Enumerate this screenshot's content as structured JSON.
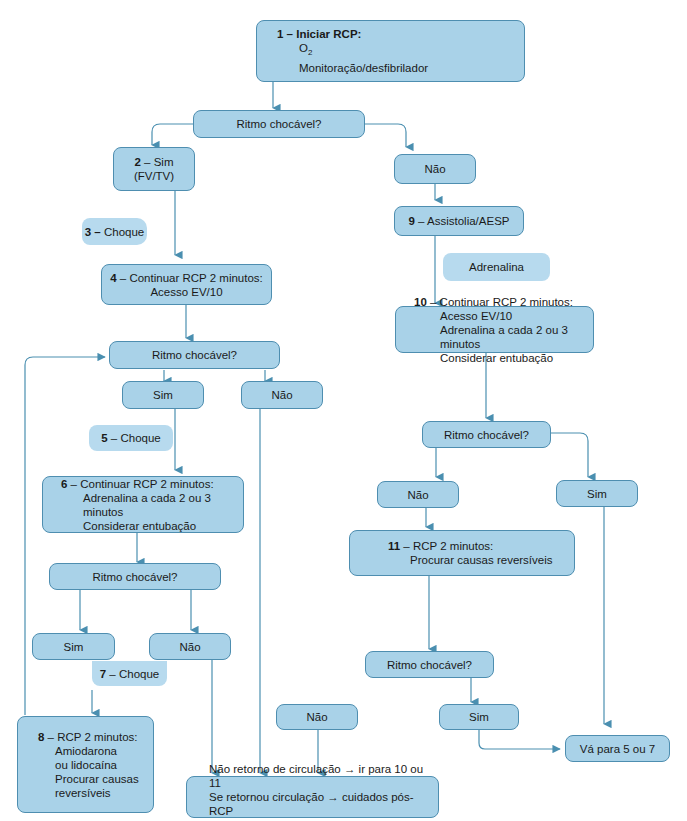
{
  "colors": {
    "box_fill": "#a9d2e8",
    "box_border": "#4e8eb0",
    "connector": "#4a8fb0"
  },
  "nodes": {
    "n1": {
      "num": "1 –",
      "title": "Iniciar RCP:",
      "lines": [
        "O",
        "Monitoração/desfibrilador"
      ],
      "o2_sub": "2"
    },
    "q1": {
      "label": "Ritmo chocável?"
    },
    "n2": {
      "num": "2",
      "label": " – Sim (FV/TV)"
    },
    "nao_top": {
      "label": "Não"
    },
    "n3": {
      "num": "3 –",
      "label": " Choque"
    },
    "n4": {
      "num": "4",
      "label": " – Continuar RCP 2 minutos:",
      "line2": "Acesso EV/10"
    },
    "n9": {
      "num": "9",
      "label": " – Assistolia/AESP"
    },
    "adrenalina": {
      "label": "Adrenalina"
    },
    "n10": {
      "num": "10",
      "label": " – Continuar RCP 2 minutos:",
      "lines": [
        "Acesso EV/10",
        "Adrenalina a cada 2 ou 3 minutos",
        "Considerar entubação"
      ]
    },
    "q2": {
      "label": "Ritmo chocável?"
    },
    "sim2": {
      "label": "Sim"
    },
    "nao2": {
      "label": "Não"
    },
    "n5": {
      "num": "5",
      "label": " – Choque"
    },
    "n6": {
      "num": "6",
      "label": " – Continuar RCP 2 minutos:",
      "lines": [
        "Adrenalina a cada 2 ou 3 minutos",
        "Considerar entubação"
      ]
    },
    "q3": {
      "label": "Ritmo chocável?"
    },
    "sim3": {
      "label": "Sim"
    },
    "nao3": {
      "label": "Não"
    },
    "n7": {
      "num": "7",
      "label": " – Choque"
    },
    "n8": {
      "num": "8",
      "label": " – RCP 2 minutos:",
      "lines": [
        "Amiodarona",
        "ou lidocaína",
        "Procurar causas",
        "reversíveis"
      ]
    },
    "q4": {
      "label": "Ritmo chocável?"
    },
    "nao4": {
      "label": "Não"
    },
    "sim4": {
      "label": "Sim"
    },
    "n11": {
      "num": "11",
      "label": " – RCP 2 minutos:",
      "line2": "Procurar causas reversíveis"
    },
    "q5": {
      "label": "Ritmo chocável?"
    },
    "sim5": {
      "label": "Sim"
    },
    "nao5": {
      "label": "Não"
    },
    "va": {
      "label": "Vá para 5 ou 7"
    },
    "final": {
      "lines": [
        "Não retorno de circulação → ir para 10 ou 11",
        "Se retornou circulação → cuidados pós-RCP",
        "Avaliar continuar RCP"
      ]
    }
  }
}
